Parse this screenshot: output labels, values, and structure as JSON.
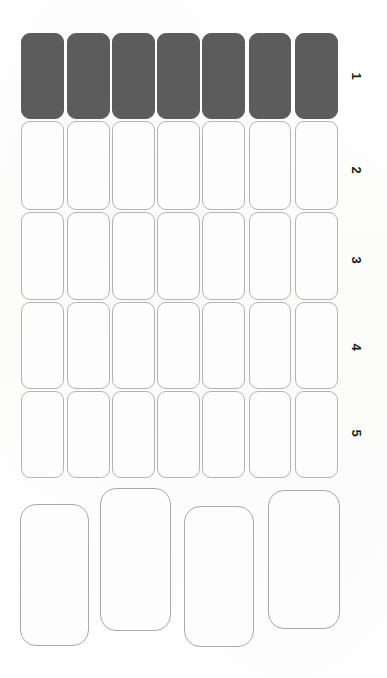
{
  "document": {
    "type": "grid-form-sheet",
    "description": "Scanned sheet of rounded rectangular cells arranged in a 5 by 7 grid with a lower band of four larger cells",
    "background_color": "#fefefe",
    "cell_border_color": "#b4b4b4",
    "filled_cell_color": "#5c5c5c"
  },
  "grid": {
    "columns": 7,
    "rows": 5,
    "row_labels": [
      "1",
      "2",
      "3",
      "4",
      "5"
    ],
    "rows_data": [
      {
        "label": "1",
        "label_x": 356,
        "label_y": 76,
        "top": 33,
        "height": 86,
        "cells": [
          {
            "filled": true,
            "x": 21,
            "width": 43
          },
          {
            "filled": true,
            "x": 67,
            "width": 43
          },
          {
            "filled": true,
            "x": 112,
            "width": 43
          },
          {
            "filled": true,
            "x": 157,
            "width": 43
          },
          {
            "filled": true,
            "x": 202,
            "width": 43
          },
          {
            "filled": true,
            "x": 249,
            "width": 42
          },
          {
            "filled": true,
            "x": 295,
            "width": 43
          }
        ]
      },
      {
        "label": "2",
        "label_x": 356,
        "label_y": 170,
        "top": 121,
        "height": 89,
        "cells": [
          {
            "filled": false,
            "x": 21,
            "width": 43
          },
          {
            "filled": false,
            "x": 67,
            "width": 43
          },
          {
            "filled": false,
            "x": 112,
            "width": 43
          },
          {
            "filled": false,
            "x": 157,
            "width": 43
          },
          {
            "filled": false,
            "x": 202,
            "width": 43
          },
          {
            "filled": false,
            "x": 249,
            "width": 42
          },
          {
            "filled": false,
            "x": 295,
            "width": 43
          }
        ]
      },
      {
        "label": "3",
        "label_x": 356,
        "label_y": 260,
        "top": 212,
        "height": 88,
        "cells": [
          {
            "filled": false,
            "x": 21,
            "width": 43
          },
          {
            "filled": false,
            "x": 67,
            "width": 43
          },
          {
            "filled": false,
            "x": 112,
            "width": 43
          },
          {
            "filled": false,
            "x": 157,
            "width": 43
          },
          {
            "filled": false,
            "x": 202,
            "width": 43
          },
          {
            "filled": false,
            "x": 249,
            "width": 42
          },
          {
            "filled": false,
            "x": 295,
            "width": 43
          }
        ]
      },
      {
        "label": "4",
        "label_x": 356,
        "label_y": 347,
        "top": 302,
        "height": 87,
        "cells": [
          {
            "filled": false,
            "x": 21,
            "width": 43
          },
          {
            "filled": false,
            "x": 67,
            "width": 43
          },
          {
            "filled": false,
            "x": 112,
            "width": 43
          },
          {
            "filled": false,
            "x": 157,
            "width": 43
          },
          {
            "filled": false,
            "x": 202,
            "width": 43
          },
          {
            "filled": false,
            "x": 249,
            "width": 42
          },
          {
            "filled": false,
            "x": 295,
            "width": 43
          }
        ]
      },
      {
        "label": "5",
        "label_x": 356,
        "label_y": 433,
        "top": 391,
        "height": 87,
        "cells": [
          {
            "filled": false,
            "x": 21,
            "width": 43
          },
          {
            "filled": false,
            "x": 67,
            "width": 43
          },
          {
            "filled": false,
            "x": 112,
            "width": 43
          },
          {
            "filled": false,
            "x": 157,
            "width": 43
          },
          {
            "filled": false,
            "x": 202,
            "width": 43
          },
          {
            "filled": false,
            "x": 249,
            "width": 42
          },
          {
            "filled": false,
            "x": 295,
            "width": 43
          }
        ]
      }
    ]
  },
  "bottom_band": {
    "count": 4,
    "cells": [
      {
        "x": 20,
        "y": 504,
        "width": 69,
        "height": 142
      },
      {
        "x": 100,
        "y": 488,
        "width": 71,
        "height": 143
      },
      {
        "x": 184,
        "y": 506,
        "width": 70,
        "height": 141
      },
      {
        "x": 268,
        "y": 490,
        "width": 72,
        "height": 139
      }
    ]
  }
}
